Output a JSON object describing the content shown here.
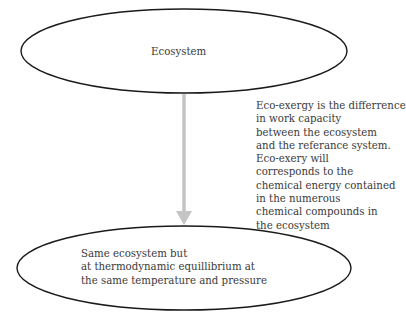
{
  "diagram": {
    "top_node": {
      "label": "Ecosystem"
    },
    "arrow": {
      "direction": "down",
      "color": "#c4c4c4"
    },
    "annotation": {
      "lines": [
        "Eco-exergy is the differrence",
        "in work capacity",
        "between the ecosystem",
        "and the referance system.",
        "Eco-exery will",
        "corresponds to the",
        "chemical energy contained",
        "in the numerous",
        "chemical compounds in",
        "the ecosystem"
      ]
    },
    "bottom_node": {
      "lines": [
        "Same ecosystem but",
        "at thermodynamic equillibrium at",
        "the same temperature and pressure"
      ]
    },
    "colors": {
      "outline": "#1a1a1a",
      "text": "#3a3a3a",
      "arrow": "#c4c4c4"
    }
  }
}
